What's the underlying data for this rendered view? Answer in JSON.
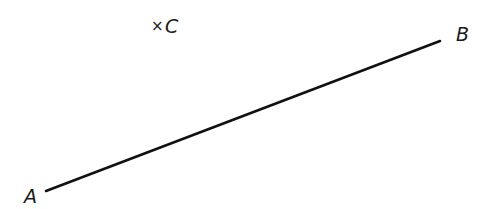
{
  "diagram": {
    "type": "geometry",
    "segment": {
      "label": "AB",
      "start": {
        "name": "A",
        "x": 46,
        "y": 191
      },
      "end": {
        "name": "B",
        "x": 440,
        "y": 41
      },
      "stroke": "#111111"
    },
    "points": [
      {
        "name": "A",
        "label": "A",
        "marker": ""
      },
      {
        "name": "B",
        "label": "B",
        "marker": ""
      },
      {
        "name": "C",
        "label": "C",
        "marker": "×"
      }
    ]
  }
}
